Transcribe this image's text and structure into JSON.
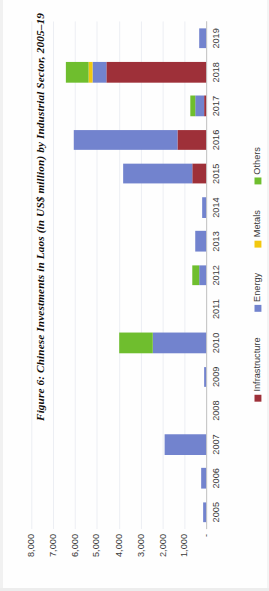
{
  "figure": {
    "title": "Figure 6: Chinese Investments in Laos (in US$ million) by Industrial Sector, 2005–19"
  },
  "chart_data": {
    "type": "bar",
    "orientation": "horizontal-stacked",
    "title": "Figure 6: Chinese Investments in Laos (in US$ million) by Industrial Sector, 2005–19",
    "xlabel": "",
    "ylabel": "US$ million",
    "categories": [
      "2005",
      "2006",
      "2007",
      "2008",
      "2009",
      "2010",
      "2011",
      "2012",
      "2013",
      "2014",
      "2015",
      "2016",
      "2017",
      "2018",
      "2019"
    ],
    "tick_labels": [
      "8,000",
      "7,000",
      "6,000",
      "5,000",
      "4,000",
      "3,000",
      "2,000",
      "1,000",
      "-"
    ],
    "ylim": [
      0,
      8000
    ],
    "grid": true,
    "legend_position": "bottom",
    "series": [
      {
        "name": "Infrastructure",
        "color": "#9e3039",
        "values": [
          0,
          0,
          0,
          0,
          0,
          0,
          0,
          0,
          0,
          0,
          620,
          1310,
          110,
          4570,
          0
        ]
      },
      {
        "name": "Energy",
        "color": "#7283ce",
        "values": [
          130,
          230,
          1910,
          0,
          110,
          2440,
          0,
          330,
          520,
          180,
          3200,
          4740,
          400,
          640,
          320
        ]
      },
      {
        "name": "Metals",
        "color": "#f2c80f",
        "values": [
          0,
          0,
          0,
          0,
          0,
          0,
          0,
          0,
          0,
          0,
          0,
          0,
          0,
          190,
          0
        ]
      },
      {
        "name": "Others",
        "color": "#6fbe2e",
        "values": [
          0,
          0,
          0,
          0,
          0,
          1530,
          0,
          290,
          0,
          0,
          0,
          0,
          230,
          1010,
          0
        ]
      }
    ]
  },
  "legend": {
    "items": [
      {
        "label": "Infrastructure",
        "color": "#9e3039"
      },
      {
        "label": "Energy",
        "color": "#7283ce"
      },
      {
        "label": "Metals",
        "color": "#f2c80f"
      },
      {
        "label": "Others",
        "color": "#6fbe2e"
      }
    ]
  }
}
